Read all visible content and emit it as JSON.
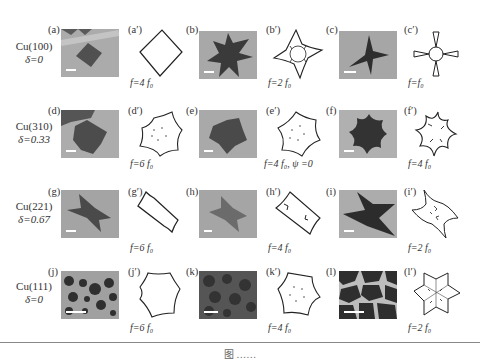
{
  "figure": {
    "rows": [
      {
        "material": "Cu(100)",
        "delta": "δ=0",
        "panels": [
          {
            "label": "(a)",
            "type": "micrograph",
            "shape": "square"
          },
          {
            "label": "(a′)",
            "type": "simulated-outline",
            "shape": "square",
            "f": "f=4 f₀"
          },
          {
            "label": "(b)",
            "type": "micrograph",
            "shape": "four-arm-star"
          },
          {
            "label": "(b′)",
            "type": "simulated-outline",
            "shape": "four-point-star-dendritic",
            "f": "f=2 f₀"
          },
          {
            "label": "(c)",
            "type": "micrograph",
            "shape": "four-arm-dendrite"
          },
          {
            "label": "(c′)",
            "type": "simulated-outline",
            "shape": "four-arm-dendrite",
            "f": "f=f₀"
          }
        ]
      },
      {
        "material": "Cu(310)",
        "delta": "δ=0.33",
        "panels": [
          {
            "label": "(d)",
            "type": "micrograph",
            "shape": "hexagon-concave"
          },
          {
            "label": "(d′)",
            "type": "simulated-outline",
            "shape": "hexagon-concave",
            "f": "f=6 f₀"
          },
          {
            "label": "(e)",
            "type": "micrograph",
            "shape": "hexagon-concave"
          },
          {
            "label": "(e′)",
            "type": "simulated-outline",
            "shape": "hexagon-concave",
            "f": "f=4 f₀, ψ =0"
          },
          {
            "label": "(f)",
            "type": "micrograph",
            "shape": "six-lobed-star"
          },
          {
            "label": "(f′)",
            "type": "simulated-outline",
            "shape": "six-lobed-star",
            "f": "f=4 f₀"
          }
        ]
      },
      {
        "material": "Cu(221)",
        "delta": "δ=0.67",
        "panels": [
          {
            "label": "(g)",
            "type": "micrograph",
            "shape": "bowtie"
          },
          {
            "label": "(g′)",
            "type": "simulated-outline",
            "shape": "rectangle-concave",
            "f": "f=6 f₀"
          },
          {
            "label": "(h)",
            "type": "micrograph",
            "shape": "bowtie-blurred"
          },
          {
            "label": "(h′)",
            "type": "simulated-outline",
            "shape": "rectangle-notched",
            "f": "f=4 f₀"
          },
          {
            "label": "(i)",
            "type": "micrograph",
            "shape": "bowtie"
          },
          {
            "label": "(i′)",
            "type": "simulated-outline",
            "shape": "four-point-star-dendritic",
            "f": "f=2 f₀"
          }
        ]
      },
      {
        "material": "Cu(111)",
        "delta": "δ=0",
        "panels": [
          {
            "label": "(j)",
            "type": "micrograph",
            "shape": "many-hexagons"
          },
          {
            "label": "(j′)",
            "type": "simulated-outline",
            "shape": "hexagon-concave",
            "f": "f=6 f₀"
          },
          {
            "label": "(k)",
            "type": "micrograph",
            "shape": "many-hexagons-dark"
          },
          {
            "label": "(k′)",
            "type": "simulated-outline",
            "shape": "hexagon-concave",
            "f": "f=4 f₀"
          },
          {
            "label": "(l)",
            "type": "micrograph",
            "shape": "dense-dendrites"
          },
          {
            "label": "(l′)",
            "type": "simulated-outline",
            "shape": "six-point-star-dendritic",
            "f": "f=2 f₀"
          }
        ]
      }
    ],
    "caption": "图 ……"
  },
  "colors": {
    "photo_bg": "#a9a9a9",
    "island": "#4a4a4a",
    "outline_stroke": "#222222"
  }
}
